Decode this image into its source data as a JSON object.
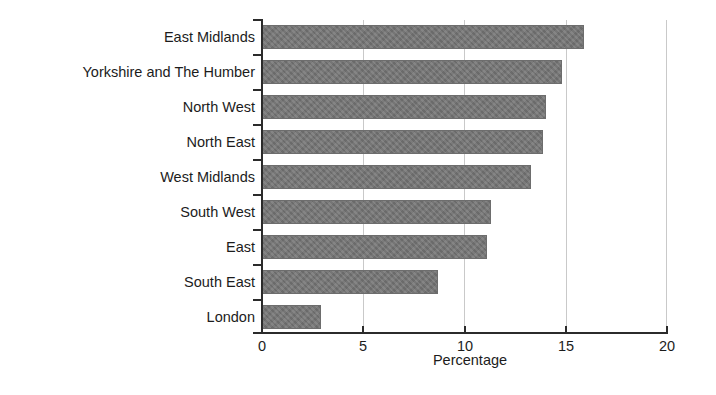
{
  "chart_data": {
    "type": "bar",
    "orientation": "horizontal",
    "title": "",
    "subtitle": "",
    "xlabel": "Percentage",
    "ylabel": "",
    "xlim": [
      0,
      20
    ],
    "xticks": [
      0,
      5,
      10,
      15,
      20
    ],
    "xtick_labels": [
      "0",
      "5",
      "10",
      "15",
      "20"
    ],
    "grid": true,
    "grid_axis": "x",
    "legend": null,
    "legend_position": "none",
    "bar_color": "#757575",
    "categories": [
      "East Midlands",
      "Yorkshire and The Humber",
      "North West",
      "North East",
      "West Midlands",
      "South West",
      "East",
      "South East",
      "London"
    ],
    "values": [
      15.9,
      14.8,
      14.0,
      13.9,
      13.3,
      11.3,
      11.1,
      8.7,
      2.9
    ],
    "bars": [
      {
        "category": "East Midlands",
        "value": 15.9
      },
      {
        "category": "Yorkshire and The Humber",
        "value": 14.8
      },
      {
        "category": "North West",
        "value": 14.0
      },
      {
        "category": "North East",
        "value": 13.9
      },
      {
        "category": "West Midlands",
        "value": 13.3
      },
      {
        "category": "South West",
        "value": 11.3
      },
      {
        "category": "East",
        "value": 11.1
      },
      {
        "category": "South East",
        "value": 8.7
      },
      {
        "category": "London",
        "value": 2.9
      }
    ]
  }
}
